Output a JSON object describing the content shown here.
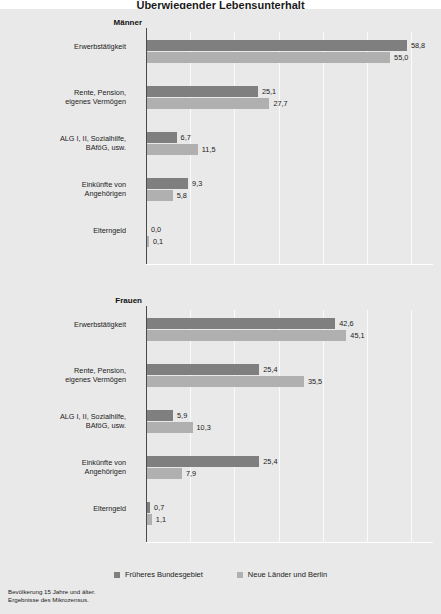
{
  "title": "Überwiegender Lebensunterhalt",
  "legend": {
    "west_label": "Früheres Bundesgebiet",
    "east_label": "Neue Länder und Berlin",
    "west_color": "#7f7f7f",
    "east_color": "#b0b0b0"
  },
  "footnote": {
    "line1": "Bevölkerung 15 Jahre und älter.",
    "line2": "Ergebnisse des Mikrozensus."
  },
  "chart_data": [
    {
      "type": "bar",
      "title": "Männer",
      "orientation": "horizontal",
      "xlabel": "",
      "ylabel": "",
      "xlim": [
        0,
        65
      ],
      "grid": true,
      "legend_position": "bottom",
      "categories": [
        "Erwerbstätigkeit",
        "Rente, Pension,\neigenes Vermögen",
        "ALG I, II, Sozialhilfe,\nBAföG, usw.",
        "Einkünfte von\nAngehörigen",
        "Elterngeld"
      ],
      "series": [
        {
          "name": "Früheres Bundesgebiet",
          "values": [
            58.8,
            25.1,
            6.7,
            9.3,
            0.0
          ]
        },
        {
          "name": "Neue Länder und Berlin",
          "values": [
            55.0,
            27.7,
            11.5,
            5.8,
            0.1
          ]
        }
      ],
      "value_labels": [
        {
          "west": "58,8",
          "east": "55,0"
        },
        {
          "west": "25,1",
          "east": "27,7"
        },
        {
          "west": "6,7",
          "east": "11,5"
        },
        {
          "west": "9,3",
          "east": "5,8"
        },
        {
          "west": "0,0",
          "east": "0,1"
        }
      ]
    },
    {
      "type": "bar",
      "title": "Frauen",
      "orientation": "horizontal",
      "xlabel": "",
      "ylabel": "",
      "xlim": [
        0,
        65
      ],
      "grid": true,
      "legend_position": "bottom",
      "categories": [
        "Erwerbstätigkeit",
        "Rente, Pension,\neigenes Vermögen",
        "ALG I, II, Sozialhilfe,\nBAföG, usw.",
        "Einkünfte von\nAngehörigen",
        "Elterngeld"
      ],
      "series": [
        {
          "name": "Früheres Bundesgebiet",
          "values": [
            42.6,
            25.4,
            5.9,
            25.4,
            0.7
          ]
        },
        {
          "name": "Neue Länder und Berlin",
          "values": [
            45.1,
            35.5,
            10.3,
            7.9,
            1.1
          ]
        }
      ],
      "value_labels": [
        {
          "west": "42,6",
          "east": "45,1"
        },
        {
          "west": "25,4",
          "east": "35,5"
        },
        {
          "west": "5,9",
          "east": "10,3"
        },
        {
          "west": "25,4",
          "east": "7,9"
        },
        {
          "west": "0,7",
          "east": "1,1"
        }
      ]
    }
  ]
}
